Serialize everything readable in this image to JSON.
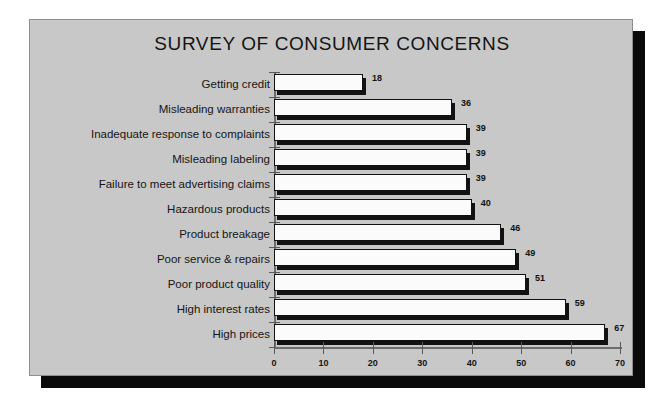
{
  "page": {
    "background_color": "#ffffff",
    "panel_color": "#c8c8c8",
    "shadow_color": "#0a0a0a",
    "bar_fill_color": "#fbfbfb",
    "bar_border_color": "#111111",
    "text_color": "#141414"
  },
  "chart_data": {
    "type": "bar",
    "orientation": "horizontal",
    "title": "SURVEY OF CONSUMER CONCERNS",
    "subtitle": "",
    "xlabel": "",
    "ylabel": "",
    "xlim": [
      0,
      70
    ],
    "ylim": null,
    "grid": false,
    "legend": null,
    "legend_position": "none",
    "xticks": [
      0,
      10,
      20,
      30,
      40,
      50,
      60,
      70
    ],
    "xtick_labels": [
      "0",
      "10",
      "20",
      "30",
      "40",
      "50",
      "60",
      "70"
    ],
    "categories": [
      "Getting credit",
      "Misleading warranties",
      "Inadequate response to complaints",
      "Misleading labeling",
      "Failure to meet advertising claims",
      "Hazardous products",
      "Product breakage",
      "Poor service & repairs",
      "Poor product quality",
      "High interest rates",
      "High prices"
    ],
    "values": [
      18,
      36,
      39,
      39,
      39,
      40,
      46,
      49,
      51,
      59,
      67
    ],
    "data_labels": [
      "18",
      "36",
      "39",
      "39",
      "39",
      "40",
      "46",
      "49",
      "51",
      "59",
      "67"
    ]
  }
}
